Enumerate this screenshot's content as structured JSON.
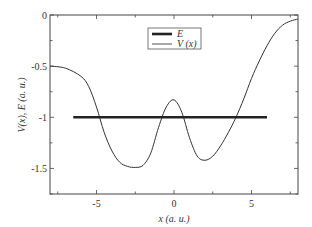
{
  "chart_data": {
    "type": "line",
    "title": "",
    "xlabel": "x  (a. u.)",
    "ylabel": "V(x),  E  (a. u.)",
    "xlim": [
      -8,
      8
    ],
    "ylim": [
      -1.75,
      0
    ],
    "xticks": [
      -5,
      0,
      5
    ],
    "xtick_labels": [
      "-5",
      "0",
      "5"
    ],
    "yticks": [
      0,
      -0.5,
      -1,
      -1.5
    ],
    "ytick_labels": [
      "0",
      "-0.5",
      "-1",
      "-1.5"
    ],
    "grid": false,
    "legend_position": "upper center",
    "series": [
      {
        "name": "E",
        "style": "thick",
        "x": [
          -6.5,
          6
        ],
        "y": [
          -1,
          -1
        ]
      },
      {
        "name": "V (x)",
        "style": "thin",
        "x": [
          -8,
          -7,
          -6,
          -5.5,
          -5,
          -4.5,
          -4,
          -3.5,
          -3,
          -2.5,
          -2,
          -1.5,
          -1,
          -0.5,
          0,
          0.5,
          1,
          1.5,
          2,
          2.5,
          3,
          3.5,
          4,
          4.5,
          5,
          5.5,
          6,
          6.5,
          7,
          7.5,
          8
        ],
        "y": [
          -0.5,
          -0.52,
          -0.6,
          -0.7,
          -0.9,
          -1.15,
          -1.33,
          -1.44,
          -1.48,
          -1.49,
          -1.47,
          -1.35,
          -1.1,
          -0.9,
          -0.83,
          -0.95,
          -1.2,
          -1.38,
          -1.42,
          -1.38,
          -1.28,
          -1.15,
          -1.0,
          -0.82,
          -0.62,
          -0.45,
          -0.3,
          -0.18,
          -0.1,
          -0.06,
          -0.04
        ]
      }
    ]
  },
  "legend": {
    "items": [
      {
        "label": "E"
      },
      {
        "label": "V (x)"
      }
    ]
  }
}
